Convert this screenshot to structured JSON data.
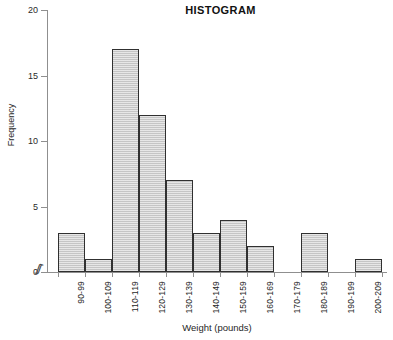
{
  "chart_data": {
    "type": "bar",
    "title": "HISTOGRAM",
    "xlabel": "Weight (pounds)",
    "ylabel": "Frequency",
    "categories": [
      "90-99",
      "100-109",
      "110-119",
      "120-129",
      "130-139",
      "140-149",
      "150-159",
      "160-169",
      "170-179",
      "180-189",
      "190-199",
      "200-209"
    ],
    "values": [
      3,
      1,
      17,
      12,
      7,
      3,
      4,
      2,
      0,
      3,
      0,
      1
    ],
    "ylim": [
      0,
      20
    ],
    "yticks": [
      0,
      5,
      10,
      15,
      20
    ],
    "ytick_labels": [
      "0",
      "5",
      "10",
      "15",
      "20"
    ],
    "grid": false,
    "legend": false,
    "bar_fill_color": "#c9c9c9",
    "bar_border_color": "#303030",
    "axis_color": "#8f8f8f",
    "axis_break_symbol": "ʃʃ",
    "axis_break_note": "x-axis break between origin and first bin"
  }
}
